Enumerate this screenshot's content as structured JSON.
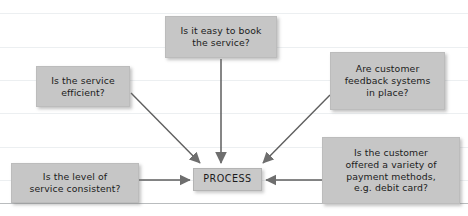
{
  "diagram": {
    "center": {
      "id": "process",
      "label": "PROCESS"
    },
    "inputs": [
      {
        "id": "book-service",
        "label": "Is it easy to book\nthe service?",
        "position": "top-center"
      },
      {
        "id": "service-efficient",
        "label": "Is the service\nefficient?",
        "position": "upper-left"
      },
      {
        "id": "feedback-systems",
        "label": "Are customer\nfeedback systems\nin place?",
        "position": "upper-right"
      },
      {
        "id": "service-consistent",
        "label": "Is the level of\nservice consistent?",
        "position": "lower-left"
      },
      {
        "id": "payment-methods",
        "label": "Is the customer\noffered a variety of\npayment methods,\ne.g. debit card?",
        "position": "lower-right"
      }
    ],
    "style": {
      "node_fill": "#c6c6c6",
      "node_border": "#bcbcbc",
      "text_color": "#1b1b1b",
      "connector_color": "#5e5e5e",
      "arrowhead_color": "#6e6e6e",
      "background": "#ffffff",
      "gridline_color": "#eceff1",
      "baseline_color": "#b9bcbe"
    },
    "gridlines_y": [
      13,
      47,
      80,
      113,
      147,
      180
    ],
    "baseline_y": 203
  }
}
